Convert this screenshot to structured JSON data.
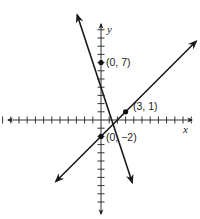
{
  "chart_data": {
    "type": "line",
    "title": "",
    "xlabel": "x",
    "ylabel": "y",
    "grid": false,
    "legend": null,
    "axis": {
      "x_ticks_left": 12,
      "x_ticks_right": 11,
      "y_ticks_up": 11,
      "y_ticks_down": 10,
      "tick_spacing_units": 1
    },
    "series": [
      {
        "name": "line-1",
        "slope": -2,
        "intercept": 7,
        "equation": "y = -2x + 7",
        "x": [
          -2.9,
          3.8
        ],
        "y": [
          12.8,
          -7.6
        ],
        "arrows": "both"
      },
      {
        "name": "line-2",
        "slope": 1,
        "intercept": -2,
        "equation": "y = x - 2",
        "x": [
          -5.5,
          11.6
        ],
        "y": [
          -7.5,
          9.6
        ],
        "arrows": "both"
      }
    ],
    "points": [
      {
        "label": "(0, 7)",
        "x": 0,
        "y": 7
      },
      {
        "label": "(3, 1)",
        "x": 3,
        "y": 1
      },
      {
        "label": "(0, −2)",
        "x": 0,
        "y": -2
      }
    ]
  },
  "labels": {
    "x_axis": "x",
    "y_axis": "y",
    "p1": "(0, 7)",
    "p2": "(3, 1)",
    "p3": "(0, −2)"
  }
}
